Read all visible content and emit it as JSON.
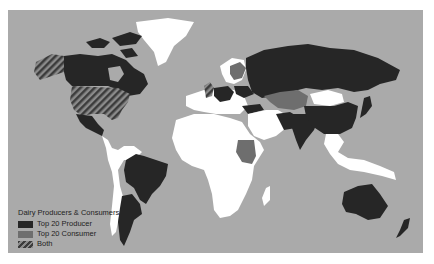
{
  "map": {
    "title": "Dairy Producers & Consumers",
    "colors": {
      "ocean": "#aaaaaa",
      "no_data": "#ffffff",
      "producer": "#262626",
      "consumer": "#6e6e6e",
      "both_stripe_a": "#444444",
      "both_stripe_b": "#888888"
    },
    "legend": {
      "title": "Dairy Producers & Consumers",
      "items": [
        {
          "label": "Top 20 Producer",
          "category": "producer"
        },
        {
          "label": "Top 20 Consumer",
          "category": "consumer"
        },
        {
          "label": "Both",
          "category": "both"
        }
      ]
    }
  }
}
